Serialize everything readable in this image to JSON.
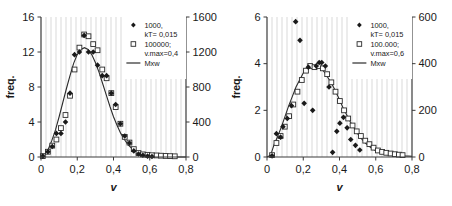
{
  "figure": {
    "panel_count": 2
  },
  "chart_data": [
    {
      "type": "scatter",
      "title": "",
      "xlabel": "v",
      "ylabel": "freq.",
      "y2label": "",
      "xlim": [
        0,
        0.8
      ],
      "ylim": [
        0,
        16
      ],
      "y2lim": [
        0,
        1600
      ],
      "xticks": [
        "0",
        "0,2",
        "0,4",
        "0,6",
        "0,8"
      ],
      "xtick_values": [
        0,
        0.2,
        0.4,
        0.6,
        0.8
      ],
      "yticks": [
        "0",
        "4",
        "8",
        "12",
        "16"
      ],
      "ytick_values": [
        0,
        4,
        8,
        12,
        16
      ],
      "y2ticks": [
        "0",
        "400",
        "800",
        "1200",
        "1600"
      ],
      "y2tick_values": [
        0,
        400,
        800,
        1200,
        1600
      ],
      "grid": "vertical-hatch",
      "legend_position": "top-right",
      "legend": [
        {
          "marker": "filled-diamond",
          "line1": "1000,",
          "line2": "kT= 0,015"
        },
        {
          "marker": "open-square",
          "line1": "100000;",
          "line2": "v.max=0,4"
        },
        {
          "marker": "line",
          "line1": "Mxw",
          "line2": ""
        }
      ],
      "series": [
        {
          "name": "1000, kT= 0,015",
          "marker": "filled-diamond",
          "axis": "left",
          "x": [
            0.01,
            0.038,
            0.062,
            0.085,
            0.11,
            0.135,
            0.16,
            0.185,
            0.212,
            0.238,
            0.262,
            0.288,
            0.312,
            0.338,
            0.362,
            0.388,
            0.412,
            0.438,
            0.462,
            0.488,
            0.512,
            0.538,
            0.562,
            0.588,
            0.612
          ],
          "values": [
            0.1,
            0.6,
            1.2,
            2.7,
            2.7,
            4.0,
            7.3,
            11.7,
            12.0,
            13.9,
            12.0,
            12.0,
            10.5,
            9.3,
            9.3,
            7.3,
            6.0,
            3.8,
            2.4,
            1.6,
            0.7,
            0.35,
            0.2,
            0.1,
            0.05
          ]
        },
        {
          "name": "100000; v.max=0,4",
          "marker": "open-square",
          "axis": "right",
          "x": [
            0.01,
            0.038,
            0.062,
            0.085,
            0.11,
            0.135,
            0.16,
            0.185,
            0.212,
            0.238,
            0.262,
            0.288,
            0.312,
            0.338,
            0.362,
            0.388,
            0.412,
            0.438,
            0.462,
            0.488,
            0.512,
            0.538,
            0.562,
            0.588,
            0.612,
            0.638,
            0.662,
            0.688,
            0.712,
            0.738
          ],
          "values": [
            10,
            60,
            130,
            200,
            330,
            480,
            700,
            1000,
            1250,
            1400,
            1380,
            1290,
            1220,
            1000,
            900,
            730,
            570,
            380,
            230,
            165,
            90,
            45,
            30,
            25,
            20,
            18,
            15,
            12,
            10,
            8
          ]
        },
        {
          "name": "Mxw",
          "marker": "line",
          "axis": "left",
          "x": [
            0.0,
            0.02,
            0.04,
            0.06,
            0.08,
            0.1,
            0.12,
            0.14,
            0.16,
            0.18,
            0.2,
            0.22,
            0.24,
            0.26,
            0.28,
            0.3,
            0.32,
            0.34,
            0.36,
            0.38,
            0.4,
            0.42,
            0.44,
            0.46,
            0.48,
            0.5,
            0.52,
            0.54,
            0.56,
            0.58,
            0.6,
            0.64,
            0.68,
            0.72,
            0.76,
            0.8
          ],
          "values": [
            0.0,
            0.25,
            0.9,
            1.9,
            3.1,
            4.6,
            6.2,
            7.8,
            9.3,
            10.7,
            11.7,
            12.3,
            12.5,
            12.3,
            11.7,
            10.8,
            9.7,
            8.4,
            7.1,
            5.8,
            4.6,
            3.6,
            2.7,
            2.0,
            1.4,
            1.0,
            0.7,
            0.47,
            0.31,
            0.2,
            0.13,
            0.05,
            0.02,
            0.01,
            0.0,
            0.0
          ]
        }
      ]
    },
    {
      "type": "scatter",
      "title": "",
      "xlabel": "v",
      "ylabel": "freq.",
      "y2label": "",
      "xlim": [
        0,
        0.8
      ],
      "ylim": [
        0,
        6
      ],
      "y2lim": [
        0,
        600
      ],
      "xticks": [
        "0",
        "0,2",
        "0,4",
        "0,6",
        "0,8"
      ],
      "xtick_values": [
        0,
        0.2,
        0.4,
        0.6,
        0.8
      ],
      "yticks": [
        "0",
        "2",
        "4",
        "6"
      ],
      "ytick_values": [
        0,
        2,
        4,
        6
      ],
      "y2ticks": [
        "0",
        "200",
        "400",
        "600"
      ],
      "y2tick_values": [
        0,
        200,
        400,
        600
      ],
      "grid": "vertical-hatch",
      "legend_position": "top-right",
      "legend": [
        {
          "marker": "filled-diamond",
          "line1": "1000,",
          "line2": "kT= 0,015"
        },
        {
          "marker": "open-square",
          "line1": "100.000;",
          "line2": "v.max=0,6"
        },
        {
          "marker": "line",
          "line1": "Mxw",
          "line2": ""
        }
      ],
      "series": [
        {
          "name": "1000, kT= 0,015",
          "marker": "filled-diamond",
          "axis": "left",
          "x": [
            0.028,
            0.052,
            0.075,
            0.088,
            0.112,
            0.135,
            0.158,
            0.182,
            0.205,
            0.228,
            0.252,
            0.272,
            0.288,
            0.302,
            0.322,
            0.342,
            0.362,
            0.385,
            0.402,
            0.422,
            0.442,
            0.462,
            0.488,
            0.512
          ],
          "values": [
            0.05,
            1.0,
            0.85,
            1.3,
            1.65,
            2.2,
            5.8,
            5.0,
            2.3,
            3.85,
            2.0,
            3.9,
            4.05,
            4.05,
            3.9,
            3.0,
            0.2,
            1.1,
            1.45,
            1.7,
            1.25,
            0.75,
            0.5,
            0.3
          ]
        },
        {
          "name": "100.000; v.max=0,6",
          "marker": "open-square",
          "axis": "right",
          "x": [
            0.028,
            0.052,
            0.075,
            0.098,
            0.122,
            0.145,
            0.168,
            0.192,
            0.215,
            0.238,
            0.262,
            0.285,
            0.308,
            0.332,
            0.355,
            0.378,
            0.402,
            0.425,
            0.448,
            0.472,
            0.495,
            0.518,
            0.542,
            0.565,
            0.588,
            0.612,
            0.635,
            0.658,
            0.682,
            0.705,
            0.728,
            0.748
          ],
          "values": [
            8,
            60,
            90,
            130,
            175,
            225,
            280,
            330,
            370,
            390,
            385,
            390,
            380,
            355,
            320,
            280,
            240,
            200,
            165,
            135,
            110,
            90,
            70,
            55,
            40,
            28,
            22,
            18,
            15,
            12,
            10,
            8
          ]
        },
        {
          "name": "Mxw",
          "marker": "line",
          "axis": "left",
          "x": [
            0.0,
            0.02,
            0.04,
            0.06,
            0.08,
            0.1,
            0.12,
            0.14,
            0.16,
            0.18,
            0.2,
            0.22,
            0.24,
            0.26,
            0.28,
            0.3,
            0.32,
            0.34,
            0.36,
            0.38,
            0.4,
            0.42,
            0.44,
            0.46,
            0.48,
            0.5,
            0.52,
            0.54,
            0.56,
            0.58,
            0.6,
            0.64,
            0.68,
            0.72,
            0.76,
            0.8
          ],
          "values": [
            0.0,
            0.08,
            0.55,
            0.9,
            1.3,
            1.75,
            2.2,
            2.6,
            3.0,
            3.3,
            3.6,
            3.8,
            3.9,
            3.92,
            3.9,
            3.8,
            3.6,
            3.35,
            3.1,
            2.8,
            2.45,
            2.1,
            1.8,
            1.5,
            1.25,
            1.0,
            0.8,
            0.62,
            0.48,
            0.36,
            0.27,
            0.18,
            0.12,
            0.08,
            0.05,
            0.03
          ]
        }
      ]
    }
  ]
}
